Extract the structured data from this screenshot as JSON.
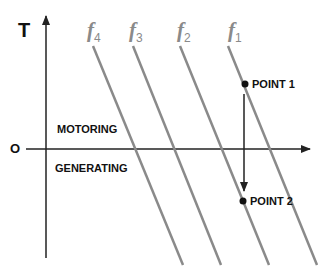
{
  "axes": {
    "y_label": "T",
    "origin_label": "O"
  },
  "regions": {
    "upper": "MOTORING",
    "lower": "GENERATING"
  },
  "curves": [
    {
      "label": "f",
      "sub": "4",
      "x_top": 93,
      "x_bottom": 183
    },
    {
      "label": "f",
      "sub": "3",
      "x_top": 133,
      "x_bottom": 221
    },
    {
      "label": "f",
      "sub": "2",
      "x_top": 180,
      "x_bottom": 269
    },
    {
      "label": "f",
      "sub": "1",
      "x_top": 228,
      "x_bottom": 317
    }
  ],
  "points": {
    "p1": {
      "label": "POINT 1",
      "x": 245,
      "y": 84
    },
    "p2": {
      "label": "POINT 2",
      "x": 243,
      "y": 202
    }
  },
  "colors": {
    "curve": "#8a8a8a",
    "axis": "#222222"
  }
}
